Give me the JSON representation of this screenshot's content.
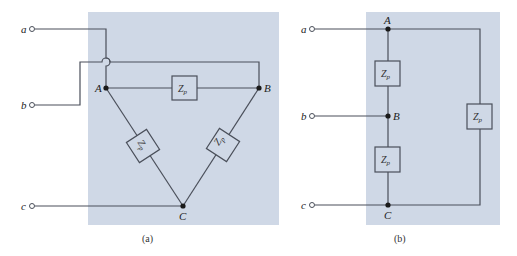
{
  "figure": {
    "panel_color": "#cfd8e6",
    "wire_color": "#4a4f5a",
    "panels": [
      {
        "id": "a",
        "caption": "(a)",
        "topology": "delta",
        "terminals": [
          {
            "label": "a"
          },
          {
            "label": "b"
          },
          {
            "label": "c"
          }
        ],
        "nodes": [
          {
            "label": "A"
          },
          {
            "label": "B"
          },
          {
            "label": "C"
          }
        ],
        "impedances": [
          {
            "label": "Z",
            "sub": "p",
            "between": "A-B"
          },
          {
            "label": "Z",
            "sub": "p",
            "between": "A-C"
          },
          {
            "label": "Z",
            "sub": "p",
            "between": "B-C"
          }
        ]
      },
      {
        "id": "b",
        "caption": "(b)",
        "topology": "delta redrawn",
        "terminals": [
          {
            "label": "a"
          },
          {
            "label": "b"
          },
          {
            "label": "c"
          }
        ],
        "nodes": [
          {
            "label": "A"
          },
          {
            "label": "B"
          },
          {
            "label": "C"
          }
        ],
        "impedances": [
          {
            "label": "Z",
            "sub": "p",
            "between": "A-B"
          },
          {
            "label": "Z",
            "sub": "p",
            "between": "B-C"
          },
          {
            "label": "Z",
            "sub": "p",
            "between": "A-C"
          }
        ]
      }
    ]
  }
}
